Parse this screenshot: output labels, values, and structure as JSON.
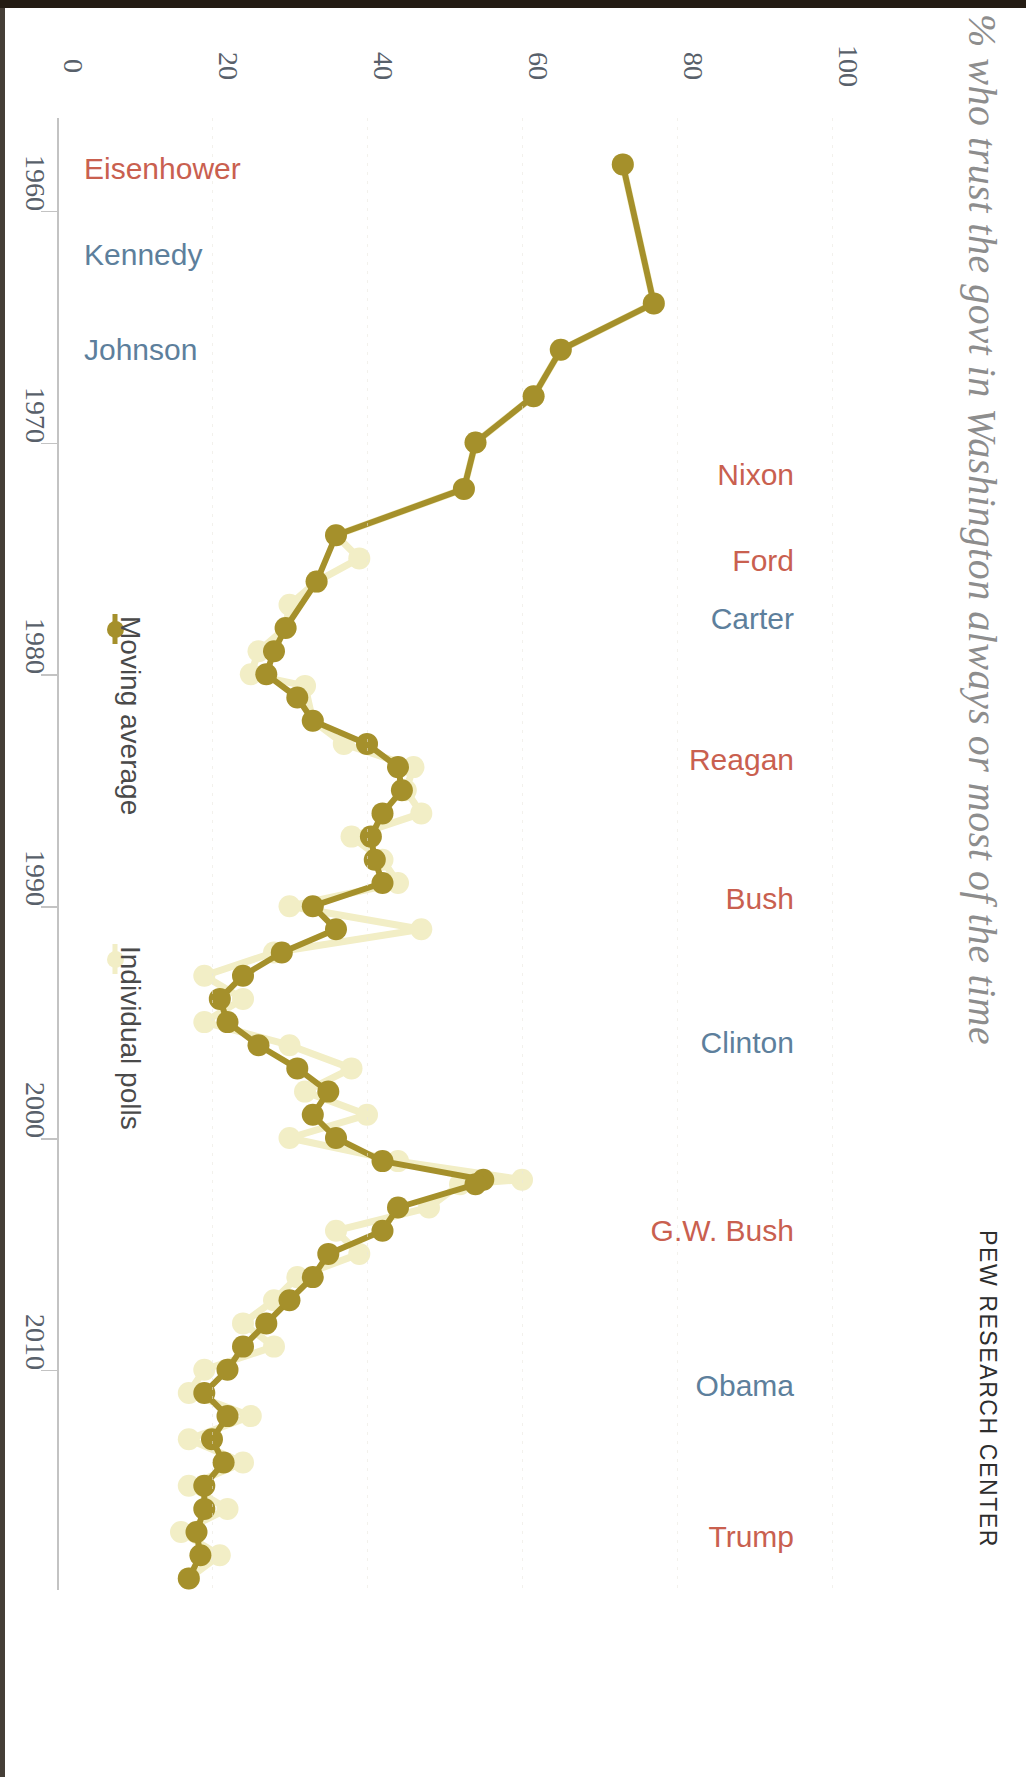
{
  "headline": "% who trust the govt in Washington always or most of the time",
  "source": "PEW RESEARCH CENTER",
  "legend": {
    "moving_average": "Moving average",
    "individual_polls": "Individual polls",
    "moving_average_color": "#a5902b",
    "individual_polls_color": "#f2eec6"
  },
  "colors": {
    "republican": "#c9604f",
    "democrat": "#5d7f9c",
    "axis": "#c3c3c3",
    "axis_text": "#58606a",
    "background": "#ffffff"
  },
  "presidents": [
    {
      "name": "Eisenhower",
      "party": "rep",
      "year": 1958.2,
      "side": "left"
    },
    {
      "name": "Kennedy",
      "party": "dem",
      "year": 1961.9,
      "side": "left"
    },
    {
      "name": "Johnson",
      "party": "dem",
      "year": 1966.0,
      "side": "left"
    },
    {
      "name": "Nixon",
      "party": "rep",
      "year": 1971.4,
      "side": "right"
    },
    {
      "name": "Ford",
      "party": "rep",
      "year": 1975.1,
      "side": "right"
    },
    {
      "name": "Carter",
      "party": "dem",
      "year": 1977.6,
      "side": "right"
    },
    {
      "name": "Reagan",
      "party": "rep",
      "year": 1983.7,
      "side": "right"
    },
    {
      "name": "Bush",
      "party": "rep",
      "year": 1989.7,
      "side": "right"
    },
    {
      "name": "Clinton",
      "party": "dem",
      "year": 1995.9,
      "side": "right"
    },
    {
      "name": "G.W. Bush",
      "party": "rep",
      "year": 2004.0,
      "side": "right"
    },
    {
      "name": "Obama",
      "party": "dem",
      "year": 2010.7,
      "side": "right"
    },
    {
      "name": "Trump",
      "party": "rep",
      "year": 2017.2,
      "side": "right"
    }
  ],
  "chart_data": {
    "type": "line",
    "title": "% who trust the govt in Washington always or most of the time",
    "xlabel": "",
    "ylabel": "",
    "xlim": [
      1956.0,
      2019.5
    ],
    "ylim": [
      0,
      100
    ],
    "xticks": [
      1960,
      1970,
      1980,
      1990,
      2000,
      2010
    ],
    "xticklabels": [
      "1960",
      "1970",
      "1980",
      "1990",
      "2000",
      "2010"
    ],
    "yticks": [
      0,
      20,
      40,
      60,
      80,
      100
    ],
    "yticklabels": [
      "0",
      "20",
      "40",
      "60",
      "80",
      "100"
    ],
    "grid": false,
    "legend_position": "left-inside",
    "series": [
      {
        "name": "Moving average",
        "color": "#a5902b",
        "marker": "circle",
        "points": [
          [
            1958.0,
            73.0
          ],
          [
            1964.0,
            77.0
          ],
          [
            1966.0,
            65.0
          ],
          [
            1968.0,
            61.5
          ],
          [
            1970.0,
            54.0
          ],
          [
            1972.0,
            52.5
          ],
          [
            1974.0,
            36.0
          ],
          [
            1976.0,
            33.5
          ],
          [
            1978.0,
            29.5
          ],
          [
            1979.0,
            28.0
          ],
          [
            1980.0,
            27.0
          ],
          [
            1981.0,
            31.0
          ],
          [
            1982.0,
            33.0
          ],
          [
            1983.0,
            40.0
          ],
          [
            1984.0,
            44.0
          ],
          [
            1985.0,
            44.5
          ],
          [
            1986.0,
            42.0
          ],
          [
            1987.0,
            40.5
          ],
          [
            1988.0,
            41.0
          ],
          [
            1989.0,
            42.0
          ],
          [
            1990.0,
            33.0
          ],
          [
            1991.0,
            36.0
          ],
          [
            1992.0,
            29.0
          ],
          [
            1993.0,
            24.0
          ],
          [
            1994.0,
            21.0
          ],
          [
            1995.0,
            22.0
          ],
          [
            1996.0,
            26.0
          ],
          [
            1997.0,
            31.0
          ],
          [
            1998.0,
            35.0
          ],
          [
            1999.0,
            33.0
          ],
          [
            2000.0,
            36.0
          ],
          [
            2001.0,
            42.0
          ],
          [
            2001.8,
            55.0
          ],
          [
            2002.0,
            54.0
          ],
          [
            2003.0,
            44.0
          ],
          [
            2004.0,
            42.0
          ],
          [
            2005.0,
            35.0
          ],
          [
            2006.0,
            33.0
          ],
          [
            2007.0,
            30.0
          ],
          [
            2008.0,
            27.0
          ],
          [
            2009.0,
            24.0
          ],
          [
            2010.0,
            22.0
          ],
          [
            2011.0,
            19.0
          ],
          [
            2012.0,
            22.0
          ],
          [
            2013.0,
            20.0
          ],
          [
            2014.0,
            21.5
          ],
          [
            2015.0,
            19.0
          ],
          [
            2016.0,
            19.0
          ],
          [
            2017.0,
            18.0
          ],
          [
            2018.0,
            18.5
          ],
          [
            2019.0,
            17.0
          ]
        ]
      },
      {
        "name": "Individual polls",
        "color": "#f2eec6",
        "marker": "circle",
        "points": [
          [
            1958.0,
            73.0
          ],
          [
            1964.0,
            77.0
          ],
          [
            1966.0,
            65.0
          ],
          [
            1968.0,
            61.5
          ],
          [
            1970.0,
            54.0
          ],
          [
            1972.0,
            52.5
          ],
          [
            1974.0,
            36.0
          ],
          [
            1975.0,
            39.0
          ],
          [
            1976.0,
            33.5
          ],
          [
            1977.0,
            30.0
          ],
          [
            1978.0,
            29.5
          ],
          [
            1979.0,
            26.0
          ],
          [
            1980.0,
            25.0
          ],
          [
            1980.5,
            32.0
          ],
          [
            1982.0,
            33.0
          ],
          [
            1983.0,
            37.0
          ],
          [
            1984.0,
            46.0
          ],
          [
            1985.0,
            45.0
          ],
          [
            1986.0,
            47.0
          ],
          [
            1987.0,
            38.0
          ],
          [
            1988.0,
            42.0
          ],
          [
            1989.0,
            44.0
          ],
          [
            1990.0,
            30.0
          ],
          [
            1991.0,
            47.0
          ],
          [
            1992.0,
            28.0
          ],
          [
            1993.0,
            19.0
          ],
          [
            1994.0,
            24.0
          ],
          [
            1995.0,
            19.0
          ],
          [
            1996.0,
            30.0
          ],
          [
            1997.0,
            38.0
          ],
          [
            1998.0,
            32.0
          ],
          [
            1999.0,
            40.0
          ],
          [
            2000.0,
            30.0
          ],
          [
            2001.0,
            44.0
          ],
          [
            2001.8,
            60.0
          ],
          [
            2002.0,
            52.0
          ],
          [
            2003.0,
            48.0
          ],
          [
            2004.0,
            36.0
          ],
          [
            2005.0,
            39.0
          ],
          [
            2006.0,
            31.0
          ],
          [
            2007.0,
            28.0
          ],
          [
            2008.0,
            24.0
          ],
          [
            2009.0,
            28.0
          ],
          [
            2010.0,
            19.0
          ],
          [
            2011.0,
            17.0
          ],
          [
            2012.0,
            25.0
          ],
          [
            2013.0,
            17.0
          ],
          [
            2014.0,
            24.0
          ],
          [
            2015.0,
            17.0
          ],
          [
            2016.0,
            22.0
          ],
          [
            2017.0,
            16.0
          ],
          [
            2018.0,
            21.0
          ],
          [
            2019.0,
            17.0
          ]
        ]
      }
    ]
  }
}
